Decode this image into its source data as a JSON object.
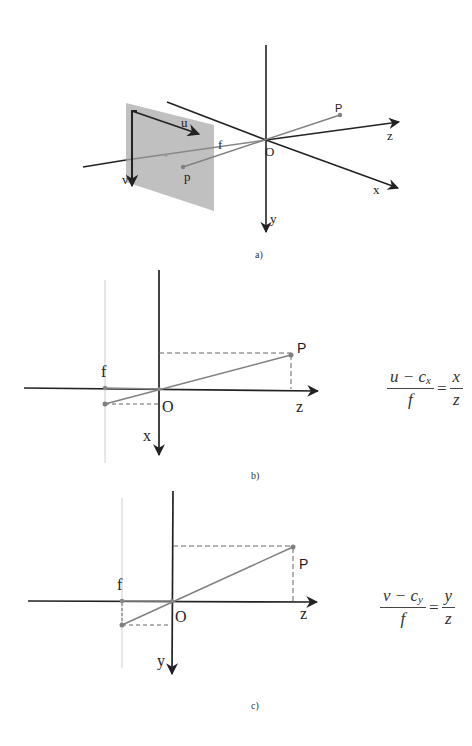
{
  "figure_a": {
    "caption": "a)",
    "labels": {
      "u": "u",
      "v": "v",
      "f": "f",
      "p_image": "p",
      "P_world": "P",
      "O": "O",
      "x": "x",
      "y": "y",
      "z": "z"
    },
    "colors": {
      "image_plane": "#bdbdbd",
      "axis": "#222222",
      "ray": "#808080"
    }
  },
  "figure_b": {
    "caption": "b)",
    "labels": {
      "f": "f",
      "O": "O",
      "x": "x",
      "z": "z",
      "P": "P"
    },
    "equation": {
      "lhs_numerator_main": "u − c",
      "lhs_numerator_sub": "x",
      "lhs_denominator": "f",
      "equals": "=",
      "rhs_numerator": "x",
      "rhs_denominator": "z"
    }
  },
  "figure_c": {
    "caption": "c)",
    "labels": {
      "f": "f",
      "O": "O",
      "y": "y",
      "z": "z",
      "P": "P"
    },
    "equation": {
      "lhs_numerator_main": "v − c",
      "lhs_numerator_sub": "y",
      "lhs_denominator": "f",
      "equals": "=",
      "rhs_numerator": "y",
      "rhs_denominator": "z"
    }
  }
}
